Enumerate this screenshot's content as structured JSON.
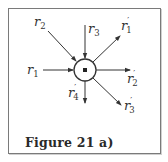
{
  "figure": {
    "caption": "Figure 21 a)",
    "node": {
      "label": "node",
      "cx": 85,
      "cy": 70,
      "r": 11
    },
    "incoming": [
      {
        "name": "r1",
        "base": "r",
        "sub": "1",
        "prime": false
      },
      {
        "name": "r2",
        "base": "r",
        "sub": "2",
        "prime": false
      },
      {
        "name": "r3",
        "base": "r",
        "sub": "3",
        "prime": false
      }
    ],
    "outgoing": [
      {
        "name": "r1'",
        "base": "r",
        "sub": "1",
        "prime": true
      },
      {
        "name": "r2'",
        "base": "r",
        "sub": "2",
        "prime": true
      },
      {
        "name": "r3'",
        "base": "r",
        "sub": "3",
        "prime": true
      },
      {
        "name": "r4'",
        "base": "r",
        "sub": "4",
        "prime": true
      }
    ],
    "colors": {
      "stroke": "#333333",
      "frame": "#7a7a7a",
      "background": "#ffffff"
    }
  }
}
